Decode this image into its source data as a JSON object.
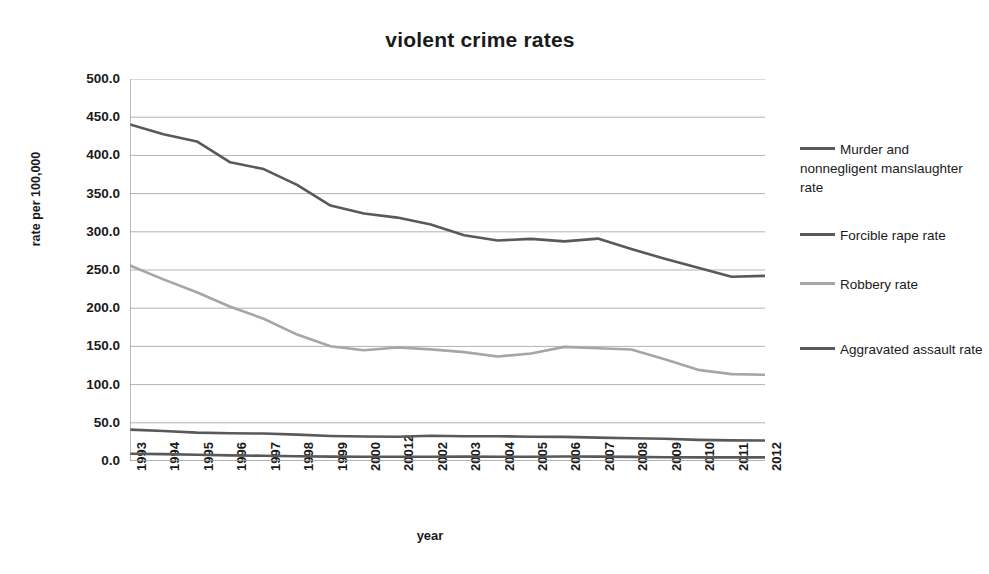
{
  "chart_data": {
    "type": "line",
    "title": "violent crime rates",
    "xlabel": "year",
    "ylabel": "rate per 100,000",
    "grid": true,
    "legend_position": "right",
    "ylim": [
      0,
      500
    ],
    "ytick_step": 50,
    "ytick_labels": [
      "500.0",
      "450.0",
      "400.0",
      "350.0",
      "300.0",
      "250.0",
      "200.0",
      "150.0",
      "100.0",
      "50.0",
      "0.0"
    ],
    "categories": [
      "1993",
      "1994",
      "1995",
      "1996",
      "1997",
      "1998",
      "1999",
      "2000",
      "20012",
      "2002",
      "2003",
      "2004",
      "2005",
      "2006",
      "2007",
      "2008",
      "2009",
      "2010",
      "2011",
      "2012"
    ],
    "series": [
      {
        "name": "Aggravated assault rate",
        "legend_label": "Aggravated assault rate",
        "color": "#595959",
        "values": [
          440.5,
          427.6,
          418.3,
          391.0,
          382.1,
          361.4,
          334.3,
          324.0,
          318.6,
          309.5,
          295.4,
          288.6,
          290.8,
          287.5,
          291.1,
          277.5,
          264.7,
          252.8,
          241.1,
          242.3
        ]
      },
      {
        "name": "Robbery rate",
        "legend_label": "Robbery rate",
        "color": "#a6a6a6",
        "values": [
          255.9,
          237.7,
          220.9,
          201.9,
          186.2,
          165.5,
          150.1,
          145.0,
          148.5,
          146.1,
          142.5,
          136.7,
          140.8,
          149.4,
          147.6,
          145.9,
          133.1,
          119.3,
          113.7,
          112.9
        ]
      },
      {
        "name": "Forcible rape rate",
        "legend_label": "Forcible rape rate",
        "color": "#595959",
        "values": [
          41.1,
          39.3,
          37.1,
          36.3,
          35.9,
          34.5,
          32.8,
          32.0,
          31.8,
          33.1,
          32.3,
          32.4,
          31.8,
          31.6,
          30.6,
          29.8,
          29.1,
          27.7,
          27.0,
          26.9
        ]
      },
      {
        "name": "Murder and nonnegligent manslaughter rate",
        "legend_label": "Murder and nonnegligent manslaughter rate",
        "color": "#595959",
        "values": [
          9.5,
          9.0,
          8.2,
          7.4,
          6.8,
          6.3,
          5.7,
          5.5,
          5.6,
          5.6,
          5.7,
          5.5,
          5.6,
          5.8,
          5.7,
          5.4,
          5.0,
          4.8,
          4.7,
          4.7
        ]
      }
    ],
    "legend_entries": [
      {
        "label": "Murder and nonnegligent manslaughter rate",
        "color": "#595959"
      },
      {
        "label": "Forcible rape rate",
        "color": "#595959"
      },
      {
        "label": "Robbery rate",
        "color": "#a6a6a6"
      },
      {
        "label": "Aggravated assault rate",
        "color": "#595959"
      }
    ],
    "axis_color": "#8c8c8c",
    "grid_color": "#b3b3b3"
  }
}
